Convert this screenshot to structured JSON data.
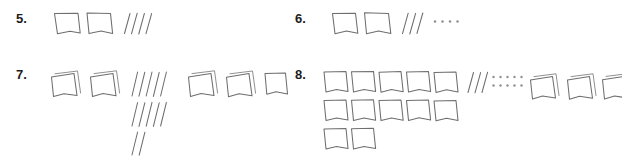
{
  "page": {
    "kind": "math-worksheet",
    "width": 622,
    "height": 167,
    "background_color": "#ffffff",
    "ink_color": "#6e6e6e",
    "ink_color_light": "#8a8a8a",
    "number_color": "#1c1c1c"
  },
  "problems": [
    {
      "id": "problem-5",
      "label": "5.",
      "groups": [
        {
          "kind": "squares",
          "style": "single",
          "rows": [
            2
          ]
        },
        {
          "kind": "tallies",
          "rows": [
            4
          ]
        }
      ]
    },
    {
      "id": "problem-6",
      "label": "6.",
      "groups": [
        {
          "kind": "squares",
          "style": "single",
          "rows": [
            2
          ]
        },
        {
          "kind": "tallies",
          "rows": [
            3
          ]
        },
        {
          "kind": "dots",
          "rows": [
            4
          ]
        }
      ]
    },
    {
      "id": "problem-7",
      "label": "7.",
      "groups": [
        {
          "kind": "squares",
          "style": "double",
          "rows": [
            2
          ]
        },
        {
          "kind": "tallies",
          "rows": [
            5,
            5,
            2
          ]
        },
        {
          "kind": "squares",
          "style": "mixed",
          "rows": [
            3
          ]
        }
      ]
    },
    {
      "id": "problem-8",
      "label": "8.",
      "groups": [
        {
          "kind": "squares",
          "style": "single",
          "rows": [
            5,
            5,
            2
          ]
        },
        {
          "kind": "tallies",
          "rows": [
            3
          ]
        },
        {
          "kind": "dots",
          "rows": [
            5,
            5
          ]
        },
        {
          "kind": "squares",
          "style": "double",
          "rows": [
            3
          ]
        }
      ]
    }
  ],
  "counts": {
    "problem_5": {
      "squares": 2,
      "tallies": 4,
      "dots": 0
    },
    "problem_6": {
      "squares": 2,
      "tallies": 3,
      "dots": 4
    },
    "problem_7": {
      "squares": 5,
      "tallies": 12,
      "dots": 0
    },
    "problem_8": {
      "squares": 15,
      "tallies": 3,
      "dots": 10
    }
  }
}
